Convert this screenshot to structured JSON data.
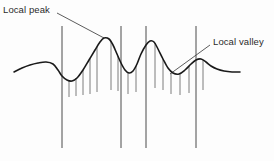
{
  "figure": {
    "background_color": "#fdfdfd",
    "annotations": [
      {
        "name": "local-peak",
        "label": "Local peak",
        "color": "#2b2b2b",
        "leader_from": [
          57,
          13
        ],
        "leader_to": [
          104,
          38
        ]
      },
      {
        "name": "local-valley",
        "label": "Local valley",
        "color": "#2b2b2b",
        "leader_from": [
          210,
          45
        ],
        "leader_to": [
          170,
          74
        ]
      }
    ],
    "curve": {
      "name": "signal-curve",
      "color": "#1a1a1a",
      "stroke_width": 1.6,
      "points": [
        [
          14,
          72
        ],
        [
          22,
          68
        ],
        [
          30,
          65
        ],
        [
          38,
          63
        ],
        [
          46,
          62
        ],
        [
          53,
          64
        ],
        [
          58,
          70
        ],
        [
          62,
          76
        ],
        [
          67,
          80
        ],
        [
          72,
          81
        ],
        [
          77,
          78
        ],
        [
          83,
          70
        ],
        [
          89,
          60
        ],
        [
          95,
          50
        ],
        [
          100,
          42
        ],
        [
          104,
          38
        ],
        [
          109,
          39
        ],
        [
          113,
          45
        ],
        [
          117,
          54
        ],
        [
          121,
          63
        ],
        [
          125,
          70
        ],
        [
          129,
          73
        ],
        [
          133,
          71
        ],
        [
          137,
          64
        ],
        [
          141,
          54
        ],
        [
          146,
          45
        ],
        [
          150,
          41
        ],
        [
          154,
          42
        ],
        [
          158,
          49
        ],
        [
          163,
          59
        ],
        [
          168,
          68
        ],
        [
          173,
          73
        ],
        [
          179,
          74
        ],
        [
          185,
          70
        ],
        [
          191,
          64
        ],
        [
          196,
          60
        ],
        [
          201,
          59
        ],
        [
          206,
          62
        ],
        [
          211,
          66
        ],
        [
          217,
          69
        ],
        [
          224,
          71
        ],
        [
          232,
          72
        ],
        [
          240,
          72
        ]
      ]
    },
    "vertical_lines": [
      {
        "name": "axis-line-1",
        "x": 62,
        "y_top": 26,
        "y_bottom": 148
      },
      {
        "name": "axis-line-2",
        "x": 121,
        "y_top": 26,
        "y_bottom": 148
      },
      {
        "name": "axis-line-3",
        "x": 146,
        "y_top": 26,
        "y_bottom": 148
      },
      {
        "name": "axis-line-4",
        "x": 196,
        "y_top": 26,
        "y_bottom": 148
      }
    ],
    "tick_marks": [
      {
        "name": "tick-mark",
        "x": 69,
        "y_top": 80,
        "y_bottom": 97
      },
      {
        "name": "tick-mark",
        "x": 76,
        "y_top": 78,
        "y_bottom": 96
      },
      {
        "name": "tick-mark",
        "x": 83,
        "y_top": 70,
        "y_bottom": 95
      },
      {
        "name": "tick-mark",
        "x": 90,
        "y_top": 59,
        "y_bottom": 94
      },
      {
        "name": "tick-mark",
        "x": 97,
        "y_top": 47,
        "y_bottom": 92
      },
      {
        "name": "tick-mark",
        "x": 111,
        "y_top": 41,
        "y_bottom": 90
      },
      {
        "name": "tick-mark",
        "x": 118,
        "y_top": 56,
        "y_bottom": 91
      },
      {
        "name": "tick-mark",
        "x": 128,
        "y_top": 72,
        "y_bottom": 94
      },
      {
        "name": "tick-mark",
        "x": 136,
        "y_top": 66,
        "y_bottom": 92
      },
      {
        "name": "tick-mark",
        "x": 155,
        "y_top": 43,
        "y_bottom": 88
      },
      {
        "name": "tick-mark",
        "x": 163,
        "y_top": 59,
        "y_bottom": 90
      },
      {
        "name": "tick-mark",
        "x": 171,
        "y_top": 73,
        "y_bottom": 94
      },
      {
        "name": "tick-mark",
        "x": 180,
        "y_top": 74,
        "y_bottom": 95
      },
      {
        "name": "tick-mark",
        "x": 189,
        "y_top": 66,
        "y_bottom": 93
      },
      {
        "name": "tick-mark",
        "x": 203,
        "y_top": 60,
        "y_bottom": 90
      }
    ]
  }
}
